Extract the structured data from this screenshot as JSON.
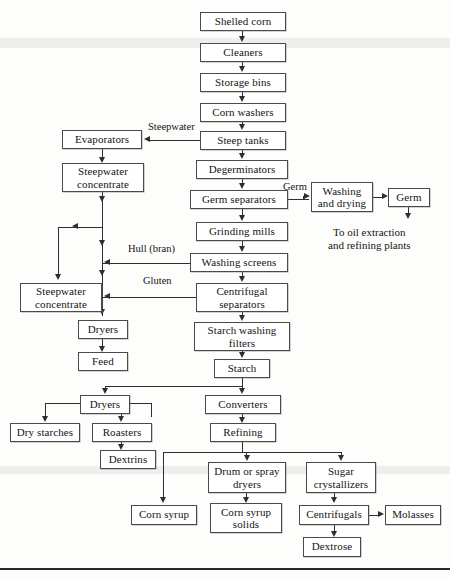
{
  "diagram": {
    "type": "process-flowchart",
    "colors": {
      "background": "#fdfdfc",
      "box_border": "#4a4a4a",
      "box_fill": "#ffffff",
      "line": "#2e2e2e",
      "text": "#141414"
    },
    "nodes": [
      {
        "id": "shelled-corn",
        "label": "Shelled corn",
        "x": 200,
        "y": 12,
        "w": 86,
        "h": 19
      },
      {
        "id": "cleaners",
        "label": "Cleaners",
        "x": 200,
        "y": 43,
        "w": 86,
        "h": 19
      },
      {
        "id": "storage-bins",
        "label": "Storage bins",
        "x": 200,
        "y": 73,
        "w": 86,
        "h": 19
      },
      {
        "id": "corn-washers",
        "label": "Corn washers",
        "x": 200,
        "y": 103,
        "w": 86,
        "h": 19
      },
      {
        "id": "steep-tanks",
        "label": "Steep tanks",
        "x": 200,
        "y": 131,
        "w": 86,
        "h": 19
      },
      {
        "id": "degerminators",
        "label": "Degerminators",
        "x": 196,
        "y": 160,
        "w": 92,
        "h": 19
      },
      {
        "id": "germ-separators",
        "label": "Germ separators",
        "x": 190,
        "y": 190,
        "w": 98,
        "h": 19
      },
      {
        "id": "grinding-mills",
        "label": "Grinding mills",
        "x": 196,
        "y": 222,
        "w": 92,
        "h": 19
      },
      {
        "id": "washing-screens",
        "label": "Washing screens",
        "x": 190,
        "y": 253,
        "w": 98,
        "h": 19
      },
      {
        "id": "centrifugal-separators",
        "label": "Centrifugal\nseparators",
        "x": 196,
        "y": 283,
        "w": 92,
        "h": 29
      },
      {
        "id": "starch-washing-filters",
        "label": "Starch washing\nfilters",
        "x": 194,
        "y": 322,
        "w": 96,
        "h": 29
      },
      {
        "id": "starch",
        "label": "Starch",
        "x": 214,
        "y": 359,
        "w": 56,
        "h": 19
      },
      {
        "id": "converters",
        "label": "Converters",
        "x": 205,
        "y": 395,
        "w": 76,
        "h": 19
      },
      {
        "id": "refining",
        "label": "Refining",
        "x": 210,
        "y": 423,
        "w": 66,
        "h": 19
      },
      {
        "id": "evaporators",
        "label": "Evaporators",
        "x": 62,
        "y": 130,
        "w": 80,
        "h": 19
      },
      {
        "id": "steepwater-concentrate-1",
        "label": "Steepwater\nconcentrate",
        "x": 62,
        "y": 163,
        "w": 82,
        "h": 29
      },
      {
        "id": "steepwater-concentrate-2",
        "label": "Steepwater\nconcentrate",
        "x": 20,
        "y": 283,
        "w": 82,
        "h": 29
      },
      {
        "id": "dryers-feed",
        "label": "Dryers",
        "x": 78,
        "y": 320,
        "w": 50,
        "h": 19
      },
      {
        "id": "feed",
        "label": "Feed",
        "x": 78,
        "y": 352,
        "w": 50,
        "h": 19
      },
      {
        "id": "dryers-starch",
        "label": "Dryers",
        "x": 80,
        "y": 395,
        "w": 50,
        "h": 19
      },
      {
        "id": "dry-starches",
        "label": "Dry starches",
        "x": 10,
        "y": 423,
        "w": 70,
        "h": 19
      },
      {
        "id": "roasters",
        "label": "Roasters",
        "x": 92,
        "y": 423,
        "w": 60,
        "h": 19
      },
      {
        "id": "dextrins",
        "label": "Dextrins",
        "x": 100,
        "y": 450,
        "w": 56,
        "h": 19
      },
      {
        "id": "washing-and-drying",
        "label": "Washing\nand drying",
        "x": 311,
        "y": 182,
        "w": 62,
        "h": 30
      },
      {
        "id": "germ",
        "label": "Germ",
        "x": 388,
        "y": 188,
        "w": 42,
        "h": 19
      },
      {
        "id": "corn-syrup",
        "label": "Corn syrup",
        "x": 131,
        "y": 505,
        "w": 66,
        "h": 20
      },
      {
        "id": "drum-or-spray-dryers",
        "label": "Drum or spray\ndryers",
        "x": 208,
        "y": 462,
        "w": 78,
        "h": 31
      },
      {
        "id": "corn-syrup-solids",
        "label": "Corn syrup\nsolids",
        "x": 210,
        "y": 503,
        "w": 72,
        "h": 30
      },
      {
        "id": "sugar-crystallizers",
        "label": "Sugar\ncrystallizers",
        "x": 306,
        "y": 462,
        "w": 70,
        "h": 31
      },
      {
        "id": "centrifugals",
        "label": "Centrifugals",
        "x": 299,
        "y": 505,
        "w": 70,
        "h": 20
      },
      {
        "id": "molasses",
        "label": "Molasses",
        "x": 385,
        "y": 505,
        "w": 56,
        "h": 20
      },
      {
        "id": "dextrose",
        "label": "Dextrose",
        "x": 303,
        "y": 537,
        "w": 58,
        "h": 20
      }
    ],
    "edge_labels": [
      {
        "id": "steepwater-label",
        "text": "Steepwater",
        "x": 148,
        "y": 121
      },
      {
        "id": "germ-label",
        "text": "Germ",
        "x": 283,
        "y": 181
      },
      {
        "id": "hull-bran-label",
        "text": "Hull (bran)",
        "x": 128,
        "y": 243
      },
      {
        "id": "gluten-label",
        "text": "Gluten",
        "x": 143,
        "y": 275
      }
    ],
    "free_texts": [
      {
        "id": "oil-extraction-note",
        "line1": "To oil extraction",
        "line2": "and refining plants",
        "x": 328,
        "y": 226
      }
    ]
  }
}
